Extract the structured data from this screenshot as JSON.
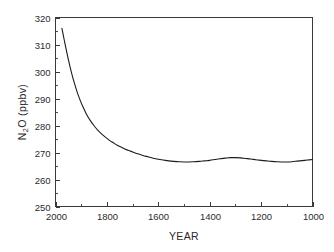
{
  "chart_data": {
    "type": "line",
    "title": "",
    "xlabel": "YEAR",
    "ylabel": "N2O (ppbv)",
    "ylabel_parts": {
      "pre": "N",
      "sub": "2",
      "post": "O (ppbv)"
    },
    "xlim": [
      2000,
      1000
    ],
    "ylim": [
      250,
      320
    ],
    "x_reversed": true,
    "grid": false,
    "legend": null,
    "x_ticks": [
      2000,
      1800,
      1600,
      1400,
      1200,
      1000
    ],
    "x_tick_labels": [
      "2000",
      "1800",
      "1600",
      "1400",
      "1200",
      "1000"
    ],
    "x_minor_ticks": [
      1900,
      1700,
      1500,
      1300,
      1100
    ],
    "y_ticks": [
      250,
      260,
      270,
      280,
      290,
      300,
      310,
      320
    ],
    "y_tick_labels": [
      "250",
      "260",
      "270",
      "280",
      "290",
      "300",
      "310",
      "320"
    ],
    "y_minor_ticks": [
      255,
      265,
      275,
      285,
      295,
      305,
      315
    ],
    "series": [
      {
        "name": "N2O concentration",
        "color": "#1c1c1c",
        "x": [
          1975,
          1965,
          1955,
          1945,
          1935,
          1925,
          1915,
          1905,
          1895,
          1880,
          1865,
          1850,
          1835,
          1820,
          1805,
          1790,
          1775,
          1760,
          1745,
          1730,
          1715,
          1700,
          1680,
          1660,
          1640,
          1620,
          1600,
          1580,
          1560,
          1540,
          1520,
          1500,
          1480,
          1460,
          1440,
          1420,
          1400,
          1380,
          1360,
          1340,
          1320,
          1300,
          1280,
          1260,
          1240,
          1220,
          1200,
          1180,
          1160,
          1140,
          1120,
          1100,
          1080,
          1060,
          1040,
          1020,
          1000
        ],
        "y": [
          316.0,
          311.2,
          306.6,
          302.4,
          298.6,
          295.2,
          292.2,
          289.6,
          287.3,
          284.3,
          281.9,
          279.9,
          278.2,
          276.8,
          275.6,
          274.5,
          273.6,
          272.7,
          272.0,
          271.3,
          270.7,
          270.2,
          269.5,
          268.9,
          268.4,
          267.9,
          267.5,
          267.2,
          266.9,
          266.7,
          266.6,
          266.5,
          266.5,
          266.6,
          266.7,
          266.9,
          267.1,
          267.4,
          267.7,
          267.9,
          268.1,
          268.1,
          268.0,
          267.8,
          267.6,
          267.3,
          267.1,
          266.9,
          266.7,
          266.6,
          266.5,
          266.5,
          266.6,
          266.8,
          267.0,
          267.2,
          267.4
        ]
      }
    ],
    "annotations": []
  }
}
